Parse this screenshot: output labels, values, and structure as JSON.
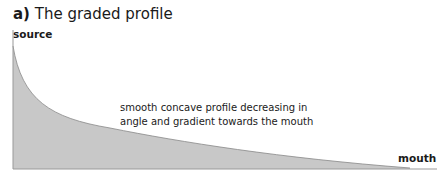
{
  "figure": {
    "label": "a)",
    "title": "The graded profile",
    "source_label": "source",
    "mouth_label": "mouth",
    "annotation_line1": "smooth concave profile decreasing in",
    "annotation_line2": "angle and gradient towards the mouth",
    "fill_color": "#c8c8c8",
    "line_color": "#888888"
  }
}
